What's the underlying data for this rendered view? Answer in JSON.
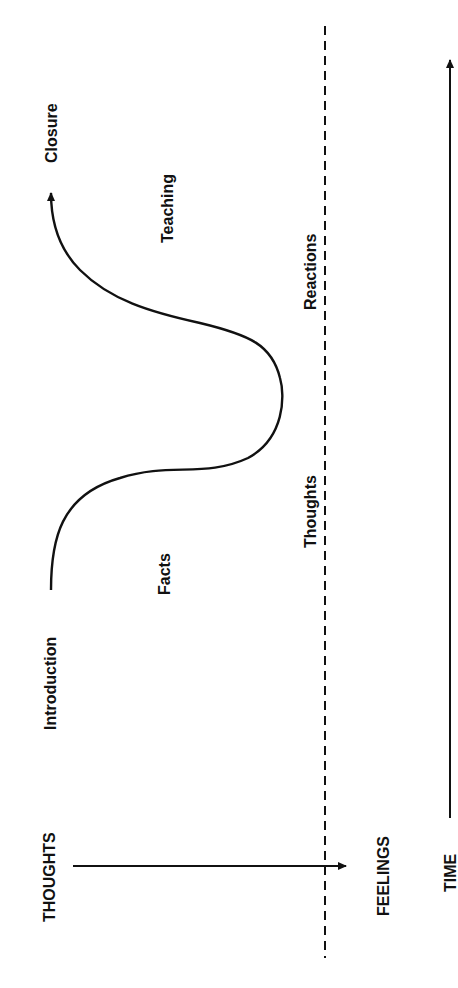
{
  "diagram": {
    "type": "conversation-flow",
    "orientation": "rotated-90-ccw",
    "colors": {
      "ink": "#111111",
      "background": "#ffffff"
    },
    "curve_labels": {
      "start": "Introduction",
      "end": "Closure",
      "lower_phase": "Facts",
      "upper_phase": "Teaching"
    },
    "divider_labels": {
      "left": "Thoughts",
      "right": "Reactions"
    },
    "axis_labels": {
      "from": "THOUGHTS",
      "to": "FEELINGS",
      "time": "TIME"
    }
  }
}
